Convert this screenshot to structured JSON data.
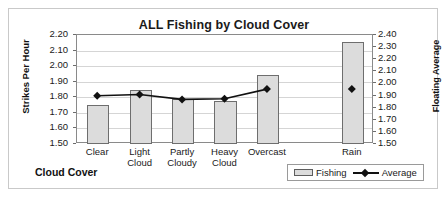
{
  "chart_data": {
    "type": "bar",
    "title": "ALL Fishing by Cloud Cover",
    "xlabel": "Cloud Cover",
    "ylabel": "Strikes Per Hour",
    "y2label": "Floating Average",
    "categories": [
      "Clear",
      "Light Cloud",
      "Partly Cloudy",
      "Heavy Cloud",
      "Overcast",
      "",
      "Rain"
    ],
    "ylim": [
      1.5,
      2.2
    ],
    "y2lim": [
      1.5,
      2.4
    ],
    "yticks": [
      "2.20",
      "2.10",
      "2.00",
      "1.90",
      "1.80",
      "1.70",
      "1.60",
      "1.50"
    ],
    "y2ticks": [
      "2.40",
      "2.30",
      "2.20",
      "2.10",
      "2.00",
      "1.90",
      "1.80",
      "1.70",
      "1.60",
      "1.50"
    ],
    "grid": true,
    "legend_position": "bottom-right",
    "series": [
      {
        "name": "Fishing",
        "kind": "bar",
        "axis": "left",
        "values": [
          1.75,
          1.845,
          1.79,
          1.775,
          1.945,
          null,
          2.155
        ]
      },
      {
        "name": "Average",
        "kind": "line",
        "axis": "right",
        "marker": "diamond",
        "values": [
          1.89,
          1.9,
          1.86,
          1.865,
          1.945,
          null,
          1.945
        ]
      }
    ]
  },
  "legend": {
    "entries": [
      {
        "label": "Fishing",
        "swatch": "bar-swatch-icon"
      },
      {
        "label": "Average",
        "swatch": "line-marker-icon"
      }
    ]
  }
}
